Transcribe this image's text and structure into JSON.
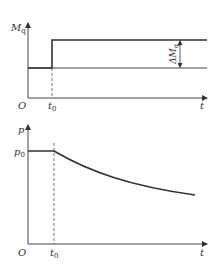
{
  "figure": {
    "top_plot": {
      "y_axis_label": "M",
      "y_axis_label_sub": "q",
      "x_axis_label": "t",
      "origin_label": "O",
      "t0_label": "t",
      "t0_label_sub": "0",
      "delta_label": "ΔM",
      "delta_label_sub": "q",
      "description": "Step increase of Mq at t0 by ΔMq"
    },
    "bottom_plot": {
      "y_axis_label": "p",
      "p0_label": "p",
      "p0_label_sub": "0",
      "x_axis_label": "t",
      "origin_label": "O",
      "t0_label": "t",
      "t0_label_sub": "0",
      "description": "p constant at p0 until t0, then decays"
    },
    "colors": {
      "line": "#333333",
      "axis": "#444444",
      "dashed": "#555555"
    }
  }
}
